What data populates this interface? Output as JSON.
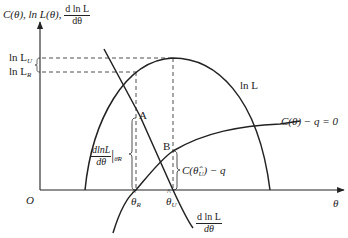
{
  "diagram": {
    "y_axis_label": {
      "c": "C(θ), ln L(θ), ",
      "frac_num": "d ln L",
      "frac_den": "dθ"
    },
    "x_axis_label": "θ",
    "origin_label": "O",
    "level_labels": [
      {
        "text": "ln L",
        "sub": "U"
      },
      {
        "text": "ln L",
        "sub": "R"
      }
    ],
    "curve_labels": {
      "lnL": "ln L",
      "constraint": "C(θ) − q = 0",
      "derivative_num": "d ln L",
      "derivative_den": "dθ"
    },
    "points": {
      "A": "A",
      "B": "B"
    },
    "theta_ticks": [
      {
        "text": "θ",
        "sub": "R"
      },
      {
        "text": "θ",
        "sub": "U"
      }
    ],
    "brace_labels": {
      "slope_num": "dlnL",
      "slope_den": "dθ",
      "slope_eval_sub": "θ̂R",
      "gap": "C(θ̂",
      "gap_sub": "U",
      "gap_tail": ") − q"
    },
    "colors": {
      "line": "#222222",
      "background": "#ffffff"
    }
  }
}
